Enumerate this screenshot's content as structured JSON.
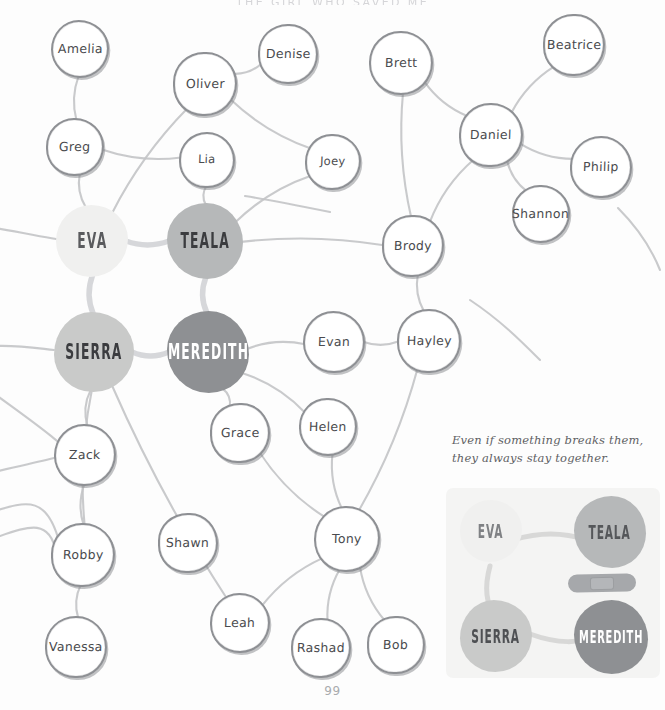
{
  "page": {
    "title": "THE GIRL WHO SAVED ME",
    "page_number": "99",
    "background_color": "#fdfdfd"
  },
  "caption": {
    "line1": "Even if something breaks them,",
    "line2": "they always stay together."
  },
  "colors": {
    "eva": "#f0f0ef",
    "teala": "#b6b8b9",
    "sierra": "#c9cac9",
    "meredith": "#8e9093",
    "edge": "#c3c4c7",
    "ink": "#8e9094",
    "inset_bg": "#f4f4f3",
    "bandage": "#a6a8ab"
  },
  "graph": {
    "type": "node-link-diagram",
    "primary_nodes": [
      {
        "id": "eva",
        "label": "EVA",
        "x": 92,
        "y": 241,
        "r": 36,
        "tone": "lightest",
        "text_color": "#5a5b5e"
      },
      {
        "id": "teala",
        "label": "TEALA",
        "x": 205,
        "y": 241,
        "r": 38,
        "tone": "medium",
        "text_color": "#3b3c3f"
      },
      {
        "id": "sierra",
        "label": "SIERRA",
        "x": 94,
        "y": 352,
        "r": 40,
        "tone": "light",
        "text_color": "#3b3c3f"
      },
      {
        "id": "meredith",
        "label": "MEREDITH",
        "x": 208,
        "y": 352,
        "r": 41,
        "tone": "dark",
        "text_color": "#ffffff"
      }
    ],
    "secondary_nodes": [
      {
        "id": "amelia",
        "label": "Amelia",
        "x": 80,
        "y": 49,
        "r": 29
      },
      {
        "id": "greg",
        "label": "Greg",
        "x": 75,
        "y": 147,
        "r": 29
      },
      {
        "id": "oliver",
        "label": "Oliver",
        "x": 205,
        "y": 84,
        "r": 32
      },
      {
        "id": "denise",
        "label": "Denise",
        "x": 288,
        "y": 54,
        "r": 30
      },
      {
        "id": "lia",
        "label": "Lia",
        "x": 207,
        "y": 160,
        "r": 28
      },
      {
        "id": "joey",
        "label": "Joey",
        "x": 333,
        "y": 162,
        "r": 28
      },
      {
        "id": "brett",
        "label": "Brett",
        "x": 401,
        "y": 63,
        "r": 32
      },
      {
        "id": "beatrice",
        "label": "Beatrice",
        "x": 574,
        "y": 45,
        "r": 31
      },
      {
        "id": "daniel",
        "label": "Daniel",
        "x": 491,
        "y": 135,
        "r": 32
      },
      {
        "id": "philip",
        "label": "Philip",
        "x": 601,
        "y": 167,
        "r": 31
      },
      {
        "id": "shannon",
        "label": "Shannon",
        "x": 541,
        "y": 214,
        "r": 29
      },
      {
        "id": "brody",
        "label": "Brody",
        "x": 413,
        "y": 246,
        "r": 31
      },
      {
        "id": "evan",
        "label": "Evan",
        "x": 334,
        "y": 342,
        "r": 31
      },
      {
        "id": "hayley",
        "label": "Hayley",
        "x": 429,
        "y": 341,
        "r": 32
      },
      {
        "id": "grace",
        "label": "Grace",
        "x": 240,
        "y": 433,
        "r": 30
      },
      {
        "id": "helen",
        "label": "Helen",
        "x": 328,
        "y": 427,
        "r": 29
      },
      {
        "id": "zack",
        "label": "Zack",
        "x": 85,
        "y": 455,
        "r": 31
      },
      {
        "id": "robby",
        "label": "Robby",
        "x": 83,
        "y": 555,
        "r": 32
      },
      {
        "id": "vanessa",
        "label": "Vanessa",
        "x": 76,
        "y": 647,
        "r": 31
      },
      {
        "id": "shawn",
        "label": "Shawn",
        "x": 188,
        "y": 543,
        "r": 30
      },
      {
        "id": "tony",
        "label": "Tony",
        "x": 347,
        "y": 539,
        "r": 33
      },
      {
        "id": "leah",
        "label": "Leah",
        "x": 240,
        "y": 623,
        "r": 30
      },
      {
        "id": "rashad",
        "label": "Rashad",
        "x": 321,
        "y": 648,
        "r": 30
      },
      {
        "id": "bob",
        "label": "Bob",
        "x": 396,
        "y": 645,
        "r": 29
      }
    ],
    "edges": [
      {
        "from": "amelia",
        "to": "greg"
      },
      {
        "from": "greg",
        "to": "eva"
      },
      {
        "from": "greg",
        "to": "lia"
      },
      {
        "from": "oliver",
        "to": "denise"
      },
      {
        "from": "oliver",
        "to": "eva"
      },
      {
        "from": "oliver",
        "to": "joey"
      },
      {
        "from": "lia",
        "to": "teala"
      },
      {
        "from": "joey",
        "to": "teala"
      },
      {
        "from": "eva",
        "to": "teala"
      },
      {
        "from": "eva",
        "to": "sierra"
      },
      {
        "from": "teala",
        "to": "meredith"
      },
      {
        "from": "sierra",
        "to": "meredith"
      },
      {
        "from": "brett",
        "to": "daniel"
      },
      {
        "from": "brett",
        "to": "brody"
      },
      {
        "from": "beatrice",
        "to": "daniel"
      },
      {
        "from": "daniel",
        "to": "philip"
      },
      {
        "from": "daniel",
        "to": "shannon"
      },
      {
        "from": "daniel",
        "to": "brody"
      },
      {
        "from": "brody",
        "to": "teala"
      },
      {
        "from": "brody",
        "to": "hayley"
      },
      {
        "from": "evan",
        "to": "hayley"
      },
      {
        "from": "evan",
        "to": "meredith"
      },
      {
        "from": "grace",
        "to": "meredith"
      },
      {
        "from": "helen",
        "to": "meredith"
      },
      {
        "from": "helen",
        "to": "tony"
      },
      {
        "from": "sierra",
        "to": "zack"
      },
      {
        "from": "sierra",
        "to": "robby"
      },
      {
        "from": "zack",
        "to": "robby"
      },
      {
        "from": "robby",
        "to": "vanessa"
      },
      {
        "from": "grace",
        "to": "tony"
      },
      {
        "from": "tony",
        "to": "leah"
      },
      {
        "from": "tony",
        "to": "rashad"
      },
      {
        "from": "tony",
        "to": "bob"
      },
      {
        "from": "tony",
        "to": "hayley"
      },
      {
        "from": "sierra",
        "to": "leah"
      }
    ]
  },
  "inset": {
    "nodes": [
      {
        "id": "eva",
        "label": "EVA",
        "text_color": "#7f8184"
      },
      {
        "id": "teala",
        "label": "TEALA",
        "text_color": "#55575a"
      },
      {
        "id": "sierra",
        "label": "SIERRA",
        "text_color": "#4e5053"
      },
      {
        "id": "meredith",
        "label": "MEREDITH",
        "text_color": "#ffffff"
      }
    ],
    "bandage_icon": "bandage-icon"
  }
}
